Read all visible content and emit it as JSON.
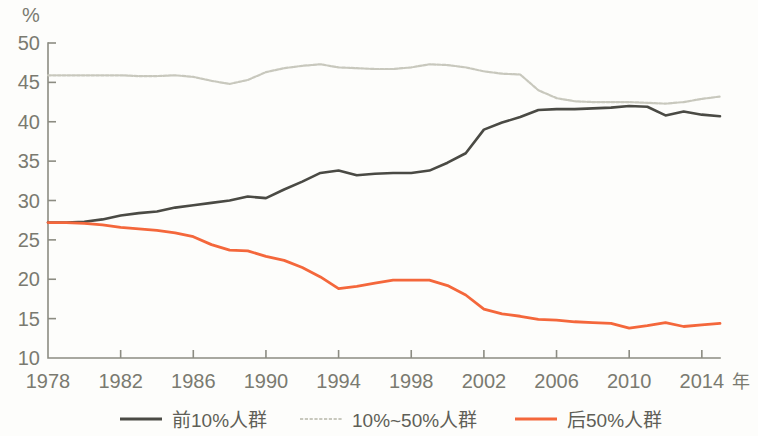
{
  "chart_data": {
    "type": "line",
    "title": "",
    "subtitle": "",
    "xlabel": "年",
    "ylabel": "%",
    "unit_label": "%",
    "xlim": [
      1978,
      2015
    ],
    "ylim": [
      10,
      50
    ],
    "grid": false,
    "legend_position": "bottom",
    "y_ticks": [
      10,
      15,
      20,
      25,
      30,
      35,
      40,
      45,
      50
    ],
    "y_tick_labels": [
      "10",
      "15",
      "20",
      "25",
      "30",
      "35",
      "40",
      "45",
      "50"
    ],
    "x_ticks": [
      1978,
      1982,
      1986,
      1990,
      1994,
      1998,
      2002,
      2006,
      2010,
      2014
    ],
    "x_tick_labels": [
      "1978",
      "1982",
      "1986",
      "1990",
      "1994",
      "1998",
      "2002",
      "2006",
      "2010",
      "2014"
    ],
    "x": [
      1978,
      1979,
      1980,
      1981,
      1982,
      1983,
      1984,
      1985,
      1986,
      1987,
      1988,
      1989,
      1990,
      1991,
      1992,
      1993,
      1994,
      1995,
      1996,
      1997,
      1998,
      1999,
      2000,
      2001,
      2002,
      2003,
      2004,
      2005,
      2006,
      2007,
      2008,
      2009,
      2010,
      2011,
      2012,
      2013,
      2014,
      2015
    ],
    "series": [
      {
        "name": "前10%人群",
        "color": "#4a4a44",
        "style": "solid",
        "width": 2.6,
        "values": [
          27.2,
          27.2,
          27.3,
          27.6,
          28.1,
          28.4,
          28.6,
          29.1,
          29.4,
          29.7,
          30.0,
          30.5,
          30.3,
          31.4,
          32.4,
          33.5,
          33.8,
          33.2,
          33.4,
          33.5,
          33.5,
          33.8,
          34.8,
          36.0,
          39.0,
          39.9,
          40.6,
          41.5,
          41.6,
          41.6,
          41.7,
          41.8,
          42.0,
          41.9,
          40.8,
          41.3,
          40.9,
          40.7
        ]
      },
      {
        "name": "10%~50%人群",
        "color": "#c8c8bd",
        "style": "dotted",
        "width": 2.2,
        "values": [
          45.9,
          45.9,
          45.9,
          45.9,
          45.9,
          45.8,
          45.8,
          45.9,
          45.7,
          45.2,
          44.8,
          45.3,
          46.3,
          46.8,
          47.1,
          47.3,
          46.9,
          46.8,
          46.7,
          46.7,
          46.9,
          47.3,
          47.2,
          46.9,
          46.4,
          46.1,
          46.0,
          44.0,
          43.0,
          42.6,
          42.5,
          42.5,
          42.5,
          42.4,
          42.3,
          42.5,
          42.9,
          43.2
        ]
      },
      {
        "name": "后50%人群",
        "color": "#f4673b",
        "style": "solid",
        "width": 2.8,
        "values": [
          27.2,
          27.2,
          27.1,
          26.9,
          26.6,
          26.4,
          26.2,
          25.9,
          25.4,
          24.4,
          23.7,
          23.6,
          22.9,
          22.4,
          21.5,
          20.3,
          18.8,
          19.1,
          19.5,
          19.9,
          19.9,
          19.9,
          19.2,
          18.0,
          16.2,
          15.6,
          15.3,
          14.9,
          14.8,
          14.6,
          14.5,
          14.4,
          13.8,
          14.1,
          14.5,
          14.0,
          14.2,
          14.4
        ]
      }
    ]
  },
  "axes": {
    "unit": "%",
    "x_axis_name": "年"
  },
  "legend": {
    "items": [
      {
        "label": "前10%人群",
        "color": "#4a4a44",
        "style": "solid"
      },
      {
        "label": "10%~50%人群",
        "color": "#c8c8bd",
        "style": "dotted"
      },
      {
        "label": "后50%人群",
        "color": "#f4673b",
        "style": "solid"
      }
    ]
  },
  "colors": {
    "top10": "#4a4a44",
    "middle40": "#c8c8bd",
    "bottom50": "#f4673b",
    "axis": "#8c8c82",
    "text": "#7a7a70",
    "background": "#fdfdfb"
  }
}
